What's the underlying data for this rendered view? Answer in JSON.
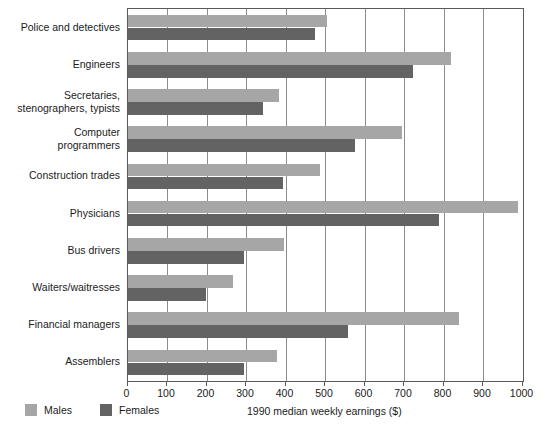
{
  "chart_data": {
    "type": "bar",
    "orientation": "horizontal",
    "title": "",
    "xlabel": "1990 median weekly earnings ($)",
    "ylabel": "",
    "xlim": [
      0,
      1000
    ],
    "xticks": [
      0,
      100,
      200,
      300,
      400,
      500,
      600,
      700,
      800,
      900,
      1000
    ],
    "grid": true,
    "legend_position": "bottom-left",
    "categories": [
      "Police and detectives",
      "Engineers",
      "Secretaries,\nstenographers, typists",
      "Computer\nprogrammers",
      "Construction trades",
      "Physicians",
      "Bus drivers",
      "Waiters/waitresses",
      "Financial managers",
      "Assemblers"
    ],
    "series": [
      {
        "name": "Males",
        "color": "#a6a6a6",
        "values": [
          504,
          819,
          383,
          694,
          487,
          988,
          397,
          268,
          838,
          378
        ]
      },
      {
        "name": "Females",
        "color": "#636363",
        "values": [
          475,
          723,
          342,
          577,
          393,
          789,
          296,
          199,
          558,
          296
        ]
      }
    ]
  },
  "legend": {
    "items": [
      {
        "label": "Males",
        "color": "#a6a6a6"
      },
      {
        "label": "Females",
        "color": "#636363"
      }
    ]
  },
  "axis": {
    "x_title": "1990 median weekly earnings ($)"
  }
}
